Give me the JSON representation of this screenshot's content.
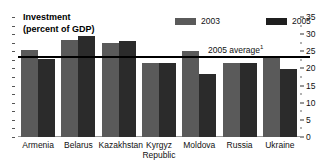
{
  "chart_data": {
    "type": "bar",
    "title": "Investment\n(percent of GDP)",
    "xlabel": "",
    "ylabel": "",
    "ylim": [
      0,
      35
    ],
    "yticks": [
      0,
      5,
      10,
      15,
      20,
      25,
      30,
      35
    ],
    "ytick_labels": [
      "0",
      "5",
      "10",
      "15",
      "20",
      "25",
      "30",
      "35"
    ],
    "axis_position": "right",
    "grid": false,
    "legend_position": "top-center",
    "categories": [
      "Armenia",
      "Belarus",
      "Kazakhstan",
      "Kyrgyz\nRepublic",
      "Moldova",
      "Russia",
      "Ukraine"
    ],
    "series": [
      {
        "name": "2003",
        "color": "#5a5a5a",
        "values": [
          25.4,
          28.3,
          27.4,
          21.6,
          25.2,
          21.5,
          23.5
        ]
      },
      {
        "name": "2005",
        "color": "#2b2b2b",
        "values": [
          22.7,
          29.5,
          27.9,
          21.7,
          18.3,
          21.5,
          19.8
        ]
      }
    ],
    "annotations": [
      {
        "name": "average-line",
        "label": "2005 average",
        "footnote": "1",
        "value": 23.0,
        "type": "hline"
      }
    ]
  },
  "legend": {
    "items": [
      {
        "label": "2003",
        "color": "#5a5a5a"
      },
      {
        "label": "2005",
        "color": "#1f1f1f"
      }
    ]
  }
}
